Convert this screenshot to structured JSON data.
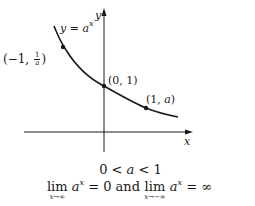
{
  "graph": {
    "axes": {
      "x_label": "x",
      "y_label": "y"
    },
    "curve_label": {
      "lhs": "y",
      "eq": "=",
      "base": "a",
      "exp": "x"
    },
    "points": [
      {
        "name": "point-neg1",
        "label_prefix": "(−1,",
        "frac_num": "1",
        "frac_den": "a",
        "label_suffix": ")"
      },
      {
        "name": "point-0",
        "label": "(0, 1)"
      },
      {
        "name": "point-1",
        "label_prefix": "(1,",
        "label_var": "a",
        "label_suffix": ")"
      }
    ]
  },
  "caption": {
    "condition": {
      "left": "0 <",
      "var": "a",
      "right": "< 1"
    },
    "limits": {
      "lim1": {
        "word": "lim",
        "sub": "x→∞",
        "base": "a",
        "exp": "x",
        "value": "= 0"
      },
      "connector": "and",
      "lim2": {
        "word": "lim",
        "sub": "x→−∞",
        "base": "a",
        "exp": "x",
        "value": "= ∞"
      }
    }
  }
}
